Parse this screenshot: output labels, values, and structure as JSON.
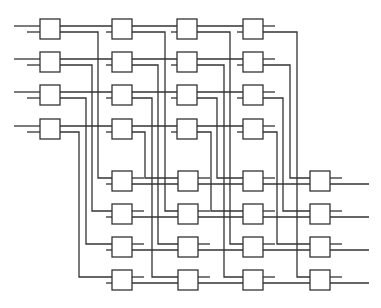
{
  "diagram": {
    "colors": {
      "stroke": "#333333",
      "background": "#ffffff",
      "box_fill": "#ffffff"
    },
    "box_size": 20,
    "top_stage": {
      "columns_x": [
        40,
        112,
        177,
        243
      ],
      "rows_y": [
        19,
        52,
        85,
        119
      ],
      "vertical_x": [
        [
          98,
          92,
          86,
          79
        ],
        [
          165,
          158,
          152,
          145
        ],
        [
          230,
          224,
          217,
          211
        ],
        [
          297,
          290,
          283,
          277
        ]
      ]
    },
    "bottom_stage": {
      "columns_x": [
        112,
        178,
        243,
        310
      ],
      "rows_y": [
        171,
        204,
        237,
        270
      ],
      "output_end_x": 369
    },
    "routing": {
      "description": "Top column c, row r lower output routes to bottom column c, row (r + c) mod 4",
      "shift_per_column": [
        0,
        1,
        2,
        3
      ]
    },
    "port_offsets": {
      "upper": 7,
      "lower": 13
    },
    "input_start": {
      "upper_x": 14,
      "lower_x": 27
    },
    "stub_length": 6
  }
}
